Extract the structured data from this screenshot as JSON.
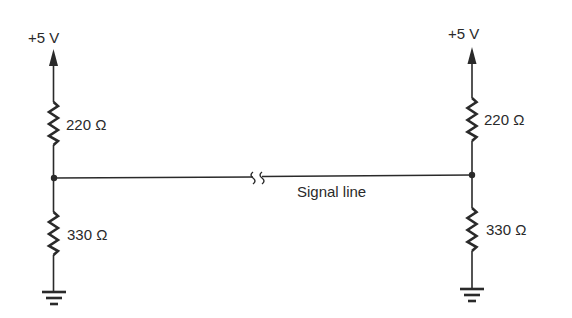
{
  "diagram": {
    "type": "circuit-schematic",
    "colors": {
      "ink": "#2a2a2a",
      "background": "#ffffff"
    },
    "left_node": {
      "supply_label": "+5 V",
      "upper_resistor_label": "220 Ω",
      "lower_resistor_label": "330 Ω",
      "ground": "ground-symbol"
    },
    "right_node": {
      "supply_label": "+5 V",
      "upper_resistor_label": "220 Ω",
      "lower_resistor_label": "330 Ω",
      "ground": "ground-symbol"
    },
    "signal_line": {
      "label": "Signal line",
      "break_symbol": "line-break-icon"
    }
  }
}
